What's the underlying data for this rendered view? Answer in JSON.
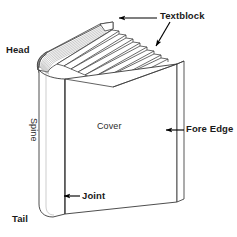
{
  "diagram": {
    "background_color": "#ffffff",
    "line_color": "#3a3a3a",
    "arrow_color": "#000000",
    "text_color": "#1a1a1a",
    "page_shade_color": "#9a9a9a",
    "labels": {
      "textblock": "Textblock",
      "head": "Head",
      "fore_edge": "Fore Edge",
      "cover": "Cover",
      "spine": "Spine",
      "joint": "Joint",
      "tail": "Tail"
    },
    "annotations": [
      {
        "label": "Textblock",
        "arrows": 2,
        "arrow_directions": [
          "left",
          "down-left"
        ]
      },
      {
        "label": "Head",
        "arrows": 0,
        "arrow_directions": []
      },
      {
        "label": "Fore Edge",
        "arrows": 1,
        "arrow_directions": [
          "left"
        ]
      },
      {
        "label": "Joint",
        "arrows": 1,
        "arrow_directions": [
          "left"
        ]
      },
      {
        "label": "Tail",
        "arrows": 0,
        "arrow_directions": []
      },
      {
        "label": "Cover",
        "arrows": 0,
        "arrow_directions": []
      },
      {
        "label": "Spine",
        "arrows": 0,
        "arrow_directions": []
      }
    ]
  }
}
